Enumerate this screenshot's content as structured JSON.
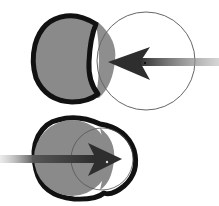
{
  "diagram": {
    "colors": {
      "fill": "#8a8a8a",
      "outline": "#111111",
      "thin_circle": "#555555",
      "arrow": "#333333",
      "background": "#ffffff"
    },
    "panels": [
      {
        "name": "top",
        "filled_circle": {
          "cx": 73,
          "cy": 58,
          "r": 41
        },
        "thin_circle": {
          "cx": 146,
          "cy": 61,
          "r": 49
        },
        "arrow": {
          "direction": "left",
          "tip_x": 108,
          "tip_y": 62,
          "tail_x": 219
        }
      },
      {
        "name": "bottom",
        "filled_circle": {
          "cx": 72,
          "cy": 158,
          "r": 40
        },
        "thin_circle": {
          "cx": 100,
          "cy": 160,
          "r": 31
        },
        "arrow": {
          "direction": "right",
          "tip_x": 122,
          "tip_y": 159,
          "tail_x": 0
        }
      }
    ]
  }
}
